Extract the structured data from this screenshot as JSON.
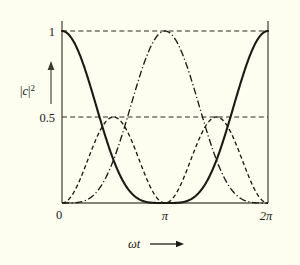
{
  "figure": {
    "background_color": "#fdfdf0",
    "ink_color": "#1b1b14",
    "axis_color": "#5a5a4e"
  },
  "labels": {
    "y_axis_title": "|c|",
    "y_axis_title_exponent": "2",
    "x_axis_title": "ωt",
    "y_tick_1": "1",
    "y_tick_05": "0.5",
    "x_tick_0": "0",
    "x_tick_pi": "π",
    "x_tick_2pi": "2π"
  },
  "chart_data": {
    "type": "line",
    "title": "",
    "xlabel": "ωt",
    "ylabel": "|c|^2",
    "xlim": [
      0,
      6.283185307179586
    ],
    "ylim": [
      0,
      1.06
    ],
    "grid": true,
    "gridlines_y": [
      0.5,
      1.0
    ],
    "legend_position": "none",
    "x_ticks": [
      0,
      3.141592653589793,
      6.283185307179586
    ],
    "x_tick_labels": [
      "0",
      "π",
      "2π"
    ],
    "y_ticks": [
      0.5,
      1.0
    ],
    "y_tick_labels": [
      "0.5",
      "1"
    ],
    "x": [
      0.0,
      0.1047,
      0.2094,
      0.3142,
      0.4189,
      0.5236,
      0.6283,
      0.733,
      0.8378,
      0.9425,
      1.0472,
      1.1519,
      1.2566,
      1.3614,
      1.4661,
      1.5708,
      1.6755,
      1.7802,
      1.885,
      1.9897,
      2.0944,
      2.1991,
      2.3038,
      2.4086,
      2.5133,
      2.618,
      2.7227,
      2.8274,
      2.9322,
      3.0369,
      3.1416,
      3.2463,
      3.351,
      3.4558,
      3.5605,
      3.6652,
      3.7699,
      3.8746,
      3.9794,
      4.0841,
      4.1888,
      4.2935,
      4.3982,
      4.5029,
      4.6077,
      4.7124,
      4.8171,
      4.9218,
      5.0265,
      5.1313,
      5.236,
      5.3407,
      5.4454,
      5.5501,
      5.6549,
      5.7596,
      5.8643,
      5.969,
      6.0737,
      6.1785,
      6.2832
    ],
    "series": [
      {
        "name": "|c1|^2",
        "style": "solid",
        "formula": "cos^4(ωt/2)",
        "values": [
          1.0,
          0.9946,
          0.9784,
          0.9517,
          0.9151,
          0.8694,
          0.8156,
          0.7549,
          0.6887,
          0.6185,
          0.5459,
          0.4726,
          0.4001,
          0.3301,
          0.264,
          0.2031,
          0.1485,
          0.1011,
          0.0616,
          0.0304,
          0.0078,
          0.0,
          0.0005,
          0.0085,
          0.0231,
          0.0437,
          0.0694,
          0.0994,
          0.133,
          0.1693,
          0.0,
          0.1693,
          0.133,
          0.0994,
          0.0694,
          0.0437,
          0.0231,
          0.0085,
          0.0005,
          0.0,
          0.0078,
          0.0304,
          0.0616,
          0.1011,
          0.1485,
          0.2031,
          0.264,
          0.3301,
          0.4001,
          0.4726,
          0.5459,
          0.6185,
          0.6887,
          0.7549,
          0.8156,
          0.8694,
          0.9151,
          0.9517,
          0.9784,
          0.9946,
          1.0
        ]
      },
      {
        "name": "|c2|^2",
        "style": "dashed",
        "formula": "2 sin^2(ωt/2) cos^2(ωt/2)",
        "peak_value": 0.5,
        "peak_positions": [
          1.5708,
          4.7124
        ],
        "values": [
          0.0,
          0.0054,
          0.0213,
          0.0469,
          0.081,
          0.1218,
          0.1674,
          0.2155,
          0.2639,
          0.3104,
          0.3536,
          0.392,
          0.4243,
          0.45,
          0.4685,
          0.4798,
          0.4842,
          0.4823,
          0.475,
          0.4634,
          0.4488,
          0.4324,
          0.4155,
          0.3991,
          0.3841,
          0.371,
          0.3603,
          0.352,
          0.3461,
          0.3424,
          0.5,
          0.3424,
          0.3461,
          0.352,
          0.3603,
          0.371,
          0.3841,
          0.3991,
          0.4155,
          0.4324,
          0.4488,
          0.4634,
          0.475,
          0.4823,
          0.4842,
          0.4798,
          0.4685,
          0.45,
          0.4243,
          0.392,
          0.3536,
          0.3104,
          0.2639,
          0.2155,
          0.1674,
          0.1218,
          0.081,
          0.0469,
          0.0213,
          0.0054,
          0.0
        ]
      },
      {
        "name": "|c3|^2",
        "style": "dash-dot",
        "formula": "sin^4(ωt/2)",
        "peak_value": 1.0,
        "peak_positions": [
          3.1416
        ],
        "values": [
          0.0,
          0.0,
          0.0001,
          0.0006,
          0.0017,
          0.0043,
          0.0087,
          0.016,
          0.0268,
          0.0417,
          0.0611,
          0.0852,
          0.1139,
          0.1472,
          0.1845,
          0.2252,
          0.2686,
          0.3136,
          0.3594,
          0.4047,
          0.4488,
          0.4903,
          0.5288,
          0.5633,
          0.5935,
          0.619,
          0.6394,
          0.6548,
          0.6651,
          0.6703,
          1.0,
          0.6703,
          0.6651,
          0.6548,
          0.6394,
          0.619,
          0.5935,
          0.5633,
          0.5288,
          0.4903,
          0.4488,
          0.4047,
          0.3594,
          0.3136,
          0.2686,
          0.2252,
          0.1845,
          0.1472,
          0.1139,
          0.0852,
          0.0611,
          0.0417,
          0.0268,
          0.016,
          0.0087,
          0.0043,
          0.0017,
          0.0006,
          0.0001,
          0.0,
          0.0
        ]
      }
    ]
  }
}
